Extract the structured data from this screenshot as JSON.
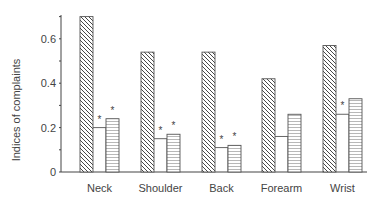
{
  "chart_data": {
    "type": "bar",
    "title": "",
    "xlabel": "",
    "ylabel": "Indices of complaints",
    "ylim": [
      0,
      0.7
    ],
    "yticks": [
      0,
      0.2,
      0.4,
      0.6
    ],
    "ytick_labels": [
      "0",
      "0.2",
      "0.4",
      "0.6"
    ],
    "grid": false,
    "legend": null,
    "categories": [
      "Neck",
      "Shoulder",
      "Back",
      "Forearm",
      "Wrist"
    ],
    "series": [
      {
        "name": "Series 1 (diagonal hatch)",
        "pattern": "diagonal",
        "values": [
          0.7,
          0.54,
          0.54,
          0.42,
          0.57
        ],
        "significant": [
          false,
          false,
          false,
          false,
          false
        ]
      },
      {
        "name": "Series 2 (blank)",
        "pattern": "blank",
        "values": [
          0.2,
          0.15,
          0.11,
          0.16,
          0.26
        ],
        "significant": [
          true,
          true,
          true,
          false,
          true
        ]
      },
      {
        "name": "Series 3 (horizontal lines)",
        "pattern": "horizontal",
        "values": [
          0.24,
          0.17,
          0.12,
          0.26,
          0.33
        ],
        "significant": [
          true,
          true,
          true,
          false,
          false
        ]
      }
    ],
    "annotations": "* marks significant difference"
  }
}
